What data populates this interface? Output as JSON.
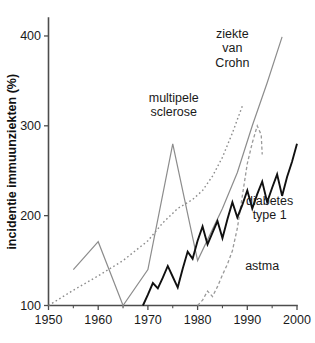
{
  "chart_data": {
    "type": "line",
    "title": "",
    "xlabel": "",
    "ylabel": "incidentie immuunziekten (%)",
    "xlim": [
      1950,
      2000
    ],
    "ylim": [
      100,
      420
    ],
    "grid": false,
    "legend_position": "inline-annotations",
    "x_ticks": [
      1950,
      1960,
      1970,
      1980,
      1990,
      2000
    ],
    "x_tick_labels": [
      "1950",
      "1960",
      "1970",
      "1980",
      "1990",
      "2000"
    ],
    "x_minor_ticks": [
      1955,
      1965,
      1975,
      1985,
      1995
    ],
    "y_ticks": [
      100,
      200,
      300,
      400
    ],
    "y_tick_labels": [
      "100",
      "200",
      "300",
      "400"
    ],
    "series": [
      {
        "name": "multipele sclerose",
        "label": "multipele sclerose",
        "style": "dotted",
        "color": "#8c8c8c",
        "width": 1.4,
        "dash": "1.6,2.6",
        "points": [
          [
            1950,
            100
          ],
          [
            1955,
            117
          ],
          [
            1960,
            133
          ],
          [
            1965,
            150
          ],
          [
            1970,
            172
          ],
          [
            1973,
            192
          ],
          [
            1976,
            208
          ],
          [
            1979,
            218
          ],
          [
            1981,
            228
          ],
          [
            1983,
            244
          ],
          [
            1985,
            265
          ],
          [
            1987,
            292
          ],
          [
            1989,
            322
          ]
        ]
      },
      {
        "name": "ziekte van Crohn",
        "label": "ziekte van Crohn",
        "style": "solid",
        "color": "#8c8c8c",
        "width": 1.2,
        "dash": "",
        "points": [
          [
            1955,
            140
          ],
          [
            1960,
            171
          ],
          [
            1965,
            100
          ],
          [
            1970,
            140
          ],
          [
            1975,
            280
          ],
          [
            1980,
            150
          ],
          [
            1985,
            208
          ],
          [
            1988,
            248
          ],
          [
            1991,
            300
          ],
          [
            1994,
            348
          ],
          [
            1997,
            399
          ]
        ]
      },
      {
        "name": "astma",
        "label": "astma",
        "style": "dashed",
        "color": "#9a9a9a",
        "width": 1.3,
        "dash": "3.2,2.4",
        "points": [
          [
            1980,
            100
          ],
          [
            1981,
            106
          ],
          [
            1982,
            116
          ],
          [
            1983,
            110
          ],
          [
            1984,
            121
          ],
          [
            1985,
            134
          ],
          [
            1986,
            146
          ],
          [
            1987,
            161
          ],
          [
            1988,
            186
          ],
          [
            1989,
            222
          ],
          [
            1990,
            258
          ],
          [
            1991,
            281
          ],
          [
            1992,
            300
          ],
          [
            1992.8,
            290
          ],
          [
            1993,
            268
          ]
        ]
      },
      {
        "name": "diabetes type 1",
        "label": "diabetes type 1",
        "style": "solid",
        "color": "#101010",
        "width": 1.9,
        "dash": "",
        "points": [
          [
            1969,
            100
          ],
          [
            1970,
            112
          ],
          [
            1971,
            125
          ],
          [
            1972,
            119
          ],
          [
            1973,
            131
          ],
          [
            1974,
            144
          ],
          [
            1975,
            132
          ],
          [
            1976,
            120
          ],
          [
            1977,
            141
          ],
          [
            1978,
            160
          ],
          [
            1979,
            152
          ],
          [
            1980,
            172
          ],
          [
            1981,
            188
          ],
          [
            1982,
            168
          ],
          [
            1983,
            181
          ],
          [
            1984,
            194
          ],
          [
            1985,
            175
          ],
          [
            1986,
            196
          ],
          [
            1987,
            215
          ],
          [
            1988,
            198
          ],
          [
            1989,
            212
          ],
          [
            1990,
            228
          ],
          [
            1991,
            208
          ],
          [
            1992,
            224
          ],
          [
            1993,
            238
          ],
          [
            1994,
            215
          ],
          [
            1995,
            231
          ],
          [
            1996,
            246
          ],
          [
            1997,
            222
          ],
          [
            1998,
            243
          ],
          [
            1999,
            260
          ],
          [
            2000,
            280
          ]
        ]
      }
    ],
    "annotations": [
      {
        "name": "ziekte-van-crohn",
        "lines": [
          "ziekte",
          "van",
          "Crohn"
        ],
        "x": 1987.0,
        "y": 398
      },
      {
        "name": "multipele-sclerose",
        "lines": [
          "multipele",
          "sclerose"
        ],
        "x": 1975.2,
        "y": 327
      },
      {
        "name": "diabetes-type-1",
        "lines": [
          "diabetes",
          "type 1"
        ],
        "x": 1994.5,
        "y": 212
      },
      {
        "name": "astma",
        "lines": [
          "astma"
        ],
        "x": 1993.0,
        "y": 140
      }
    ]
  }
}
